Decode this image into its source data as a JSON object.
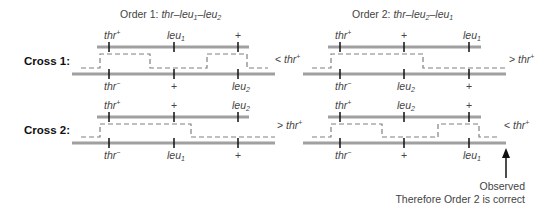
{
  "headers": {
    "order1": "Order 1:  thr–leu1–leu2",
    "order2": "Order 2:  thr–leu2–leu1"
  },
  "rows": [
    {
      "label": "Cross 1:",
      "order1": {
        "top": [
          "thr+",
          "leu1",
          "+"
        ],
        "bottom": [
          "thr−",
          "+",
          "leu2"
        ],
        "result": "< thr+"
      },
      "order2": {
        "top": [
          "thr+",
          "+",
          "leu1"
        ],
        "bottom": [
          "thr−",
          "leu2",
          "+"
        ],
        "result": "> thr+"
      }
    },
    {
      "label": "Cross 2:",
      "order1": {
        "top": [
          "thr+",
          "+",
          "leu2"
        ],
        "bottom": [
          "thr−",
          "leu1",
          "+"
        ],
        "result": "> thr+"
      },
      "order2": {
        "top": [
          "thr+",
          "leu2",
          "+"
        ],
        "bottom": [
          "thr−",
          "+",
          "leu1"
        ],
        "result": "< thr+"
      }
    }
  ],
  "annotation": {
    "line1": "Observed",
    "line2": "Therefore Order 2 is correct"
  },
  "colors": {
    "chromosome": "#a0a0a0",
    "crossover": "#808080",
    "tick": "#111111"
  }
}
